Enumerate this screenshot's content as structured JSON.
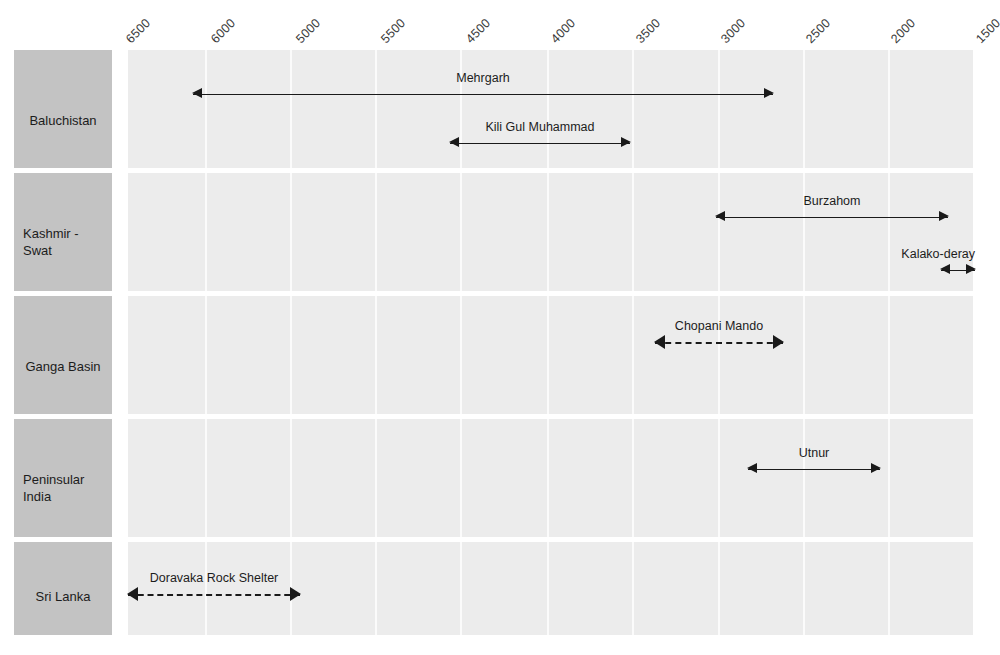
{
  "chart_data": {
    "type": "table",
    "title": "",
    "xlabel": "",
    "ylabel": "",
    "axis_direction": "reversed (older on left, younger on right)",
    "grid": true,
    "legend": "none",
    "tick_labels": [
      "6500",
      "6000",
      "5000",
      "5500",
      "4500",
      "4000",
      "3500",
      "3000",
      "2500",
      "2000",
      "1500"
    ],
    "categories": [
      "Baluchistan",
      "Kashmir - Swat",
      "Ganga Basin",
      "Peninsular India",
      "Sri Lanka"
    ],
    "series": [
      {
        "name": "Baluchistan",
        "entries": [
          {
            "label": "Mehrgarh",
            "start": "6400",
            "end": "2700",
            "style": "solid"
          },
          {
            "label": "Kili Gul Muhammad",
            "start": "4550",
            "end": "3500",
            "style": "solid"
          }
        ]
      },
      {
        "name": "Kashmir - Swat",
        "entries": [
          {
            "label": "Burzahom",
            "start": "3000",
            "end": "1650",
            "style": "solid"
          },
          {
            "label": "Kalako-deray",
            "start": "1700",
            "end": "1520",
            "style": "solid"
          }
        ]
      },
      {
        "name": "Ganga Basin",
        "entries": [
          {
            "label": "Chopani Mando",
            "start": "3350",
            "end": "2600",
            "style": "dashed"
          }
        ]
      },
      {
        "name": "Peninsular India",
        "entries": [
          {
            "label": "Utnur",
            "start": "2800",
            "end": "2030",
            "style": "solid"
          }
        ]
      },
      {
        "name": "Sri Lanka",
        "entries": [
          {
            "label": "Doravaka Rock Shelter",
            "start": "6750",
            "end": "5750",
            "style": "dashed"
          }
        ]
      }
    ],
    "colors": {
      "plot_background": "#ececec",
      "label_background": "#c3c3c3",
      "gridline": "#fbfbfb",
      "arrow": "#1a1a1a",
      "text": "#1c1c1c"
    }
  },
  "axis": {
    "ticks": [
      {
        "text": "6500",
        "x": 133
      },
      {
        "text": "6000",
        "x": 218
      },
      {
        "text": "5000",
        "x": 303
      },
      {
        "text": "5500",
        "x": 388
      },
      {
        "text": "4500",
        "x": 473
      },
      {
        "text": "4000",
        "x": 558
      },
      {
        "text": "3500",
        "x": 643
      },
      {
        "text": "3000",
        "x": 728
      },
      {
        "text": "2500",
        "x": 813
      },
      {
        "text": "2000",
        "x": 898
      },
      {
        "text": "1500",
        "x": 983
      }
    ]
  },
  "rows": [
    {
      "label": "Baluchistan",
      "label_lines": [
        "Baluchistan"
      ],
      "label_align": "centered",
      "top": 50,
      "height": 118,
      "ranges": [
        {
          "label": "Mehrgarh",
          "left": 193,
          "width": 580,
          "style": "solid",
          "top": 34,
          "label_anchor": "center"
        },
        {
          "label": "Kili Gul Muhammad",
          "left": 450,
          "width": 180,
          "style": "solid",
          "top": 83,
          "label_anchor": "center"
        }
      ]
    },
    {
      "label": "Kashmir - Swat",
      "label_lines": [
        "Kashmir -",
        "Swat"
      ],
      "label_align": "left",
      "top": 173,
      "height": 118,
      "ranges": [
        {
          "label": "Burzahom",
          "left": 716,
          "width": 232,
          "style": "solid",
          "top": 34,
          "label_anchor": "center"
        },
        {
          "label": "Kalako-deray",
          "left": 941,
          "width": 34,
          "style": "solid",
          "top": 87,
          "label_anchor": "right"
        }
      ]
    },
    {
      "label": "Ganga Basin",
      "label_lines": [
        "Ganga Basin"
      ],
      "label_align": "centered",
      "top": 296,
      "height": 118,
      "ranges": [
        {
          "label": "Chopani Mando",
          "left": 655,
          "width": 128,
          "style": "dashed",
          "top": 36,
          "label_anchor": "center"
        }
      ]
    },
    {
      "label": "Peninsular India",
      "label_lines": [
        "Peninsular",
        "India"
      ],
      "label_align": "left",
      "top": 419,
      "height": 118,
      "ranges": [
        {
          "label": "Utnur",
          "left": 748,
          "width": 132,
          "style": "solid",
          "top": 40,
          "label_anchor": "center"
        }
      ]
    },
    {
      "label": "Sri Lanka",
      "label_lines": [
        "Sri Lanka"
      ],
      "label_align": "centered",
      "top": 542,
      "height": 93,
      "ranges": [
        {
          "label": "Doravaka Rock Shelter",
          "left": 128,
          "width": 172,
          "style": "dashed",
          "top": 42,
          "label_anchor": "center"
        }
      ]
    }
  ],
  "grid": {
    "dividers": [
      205,
      290,
      375,
      460,
      547,
      632,
      718,
      803,
      888
    ]
  }
}
